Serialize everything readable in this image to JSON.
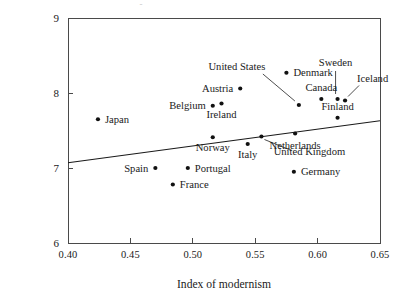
{
  "chart_data": {
    "type": "scatter",
    "title": "",
    "subtitle": "",
    "xlabel": "Index of modernism",
    "ylabel": "",
    "xlim": [
      0.4,
      0.65
    ],
    "ylim": [
      6,
      9
    ],
    "xticks": [
      0.4,
      0.45,
      0.5,
      0.55,
      0.6,
      0.65
    ],
    "xtick_labels": [
      "0.40",
      "0.45",
      "0.50",
      "0.55",
      "0.60",
      "0.65"
    ],
    "yticks": [
      6,
      7,
      8,
      9
    ],
    "ytick_labels": [
      "6",
      "7",
      "8",
      "9"
    ],
    "grid": false,
    "legend": "none",
    "marker": "filled-circle",
    "marker_color": "#111111",
    "points": [
      {
        "name": "Japan",
        "x": 0.424,
        "y": 7.65,
        "label_pos": "right",
        "leader": false
      },
      {
        "name": "Belgium",
        "x": 0.516,
        "y": 7.83,
        "label_pos": "left",
        "leader": false
      },
      {
        "name": "Spain",
        "x": 0.47,
        "y": 7.0,
        "label_pos": "left",
        "leader": false
      },
      {
        "name": "Portugal",
        "x": 0.496,
        "y": 7.0,
        "label_pos": "right",
        "leader": false
      },
      {
        "name": "France",
        "x": 0.484,
        "y": 6.78,
        "label_pos": "right",
        "leader": false
      },
      {
        "name": "Austria",
        "x": 0.538,
        "y": 8.06,
        "label_pos": "left",
        "leader": false
      },
      {
        "name": "Ireland",
        "x": 0.523,
        "y": 7.86,
        "label_pos": "below",
        "leader": false
      },
      {
        "name": "Norway",
        "x": 0.516,
        "y": 7.41,
        "label_pos": "below",
        "leader": false
      },
      {
        "name": "Italy",
        "x": 0.544,
        "y": 7.32,
        "label_pos": "below",
        "leader": false
      },
      {
        "name": "Denmark",
        "x": 0.575,
        "y": 8.27,
        "label_pos": "right",
        "leader": false
      },
      {
        "name": "Netherlands",
        "x": 0.582,
        "y": 7.46,
        "label_pos": "below",
        "leader": false
      },
      {
        "name": "Germany",
        "x": 0.581,
        "y": 6.95,
        "label_pos": "right",
        "leader": false
      },
      {
        "name": "Canada",
        "x": 0.603,
        "y": 7.92,
        "label_pos": "above",
        "leader": false
      },
      {
        "name": "Finland",
        "x": 0.616,
        "y": 7.67,
        "label_pos": "above",
        "leader": false
      },
      {
        "name": "United States",
        "x": 0.585,
        "y": 7.84,
        "label_pos": "leader",
        "leader": true
      },
      {
        "name": "Sweden",
        "x": 0.616,
        "y": 7.92,
        "label_pos": "leader",
        "leader": true
      },
      {
        "name": "Iceland",
        "x": 0.622,
        "y": 7.9,
        "label_pos": "leader",
        "leader": true
      },
      {
        "name": "United Kingdom",
        "x": 0.555,
        "y": 7.42,
        "label_pos": "leader",
        "leader": true
      }
    ],
    "fit_line": {
      "name": "regression-line",
      "x_start": 0.4,
      "y_start": 7.07,
      "x_end": 0.65,
      "y_end": 7.63
    },
    "label_offsets": {
      "Japan": {
        "dx": 7,
        "dy": 3.5
      },
      "Belgium": {
        "dx": -7,
        "dy": 3.5
      },
      "Spain": {
        "dx": -7,
        "dy": 3.5
      },
      "Portugal": {
        "dx": 7,
        "dy": 3.5
      },
      "France": {
        "dx": 7,
        "dy": 3.5
      },
      "Austria": {
        "dx": -7,
        "dy": 3.5
      },
      "Ireland": {
        "dx": 0,
        "dy": 14
      },
      "Norway": {
        "dx": 0,
        "dy": 14
      },
      "Italy": {
        "dx": 0,
        "dy": 14
      },
      "Denmark": {
        "dx": 7,
        "dy": 3.5
      },
      "Netherlands": {
        "dx": 0,
        "dy": 15
      },
      "Germany": {
        "dx": 7,
        "dy": 3.5
      },
      "Canada": {
        "dx": 0,
        "dy": -8
      },
      "Finland": {
        "dx": 0,
        "dy": -8
      },
      "United States": {
        "dx": -62,
        "dy": -35
      },
      "Sweden": {
        "dx": -2,
        "dy": -33
      },
      "Iceland": {
        "dx": 12,
        "dy": -19
      },
      "United Kingdom": {
        "dx": 48,
        "dy": 18
      }
    },
    "label_anchors": {
      "Japan": "start",
      "Belgium": "end",
      "Spain": "end",
      "Portugal": "start",
      "France": "start",
      "Austria": "end",
      "Ireland": "middle",
      "Norway": "middle",
      "Italy": "middle",
      "Denmark": "start",
      "Netherlands": "middle",
      "Germany": "start",
      "Canada": "middle",
      "Finland": "middle",
      "United States": "middle",
      "Sweden": "middle",
      "Iceland": "start",
      "United Kingdom": "middle"
    },
    "leader_paths": {
      "United States": {
        "x1": -36,
        "y1": -31,
        "x2": -4,
        "y2": -4
      },
      "Sweden": {
        "x1": -2,
        "y1": -28,
        "x2": -2,
        "y2": -5
      },
      "Iceland": {
        "x1": 14,
        "y1": -15,
        "x2": 3,
        "y2": -4
      },
      "United Kingdom": {
        "x1": 30,
        "y1": 14,
        "x2": 3,
        "y2": 3
      }
    }
  },
  "axis": {
    "x_title": "Index of modernism",
    "top_ghost": "-"
  }
}
